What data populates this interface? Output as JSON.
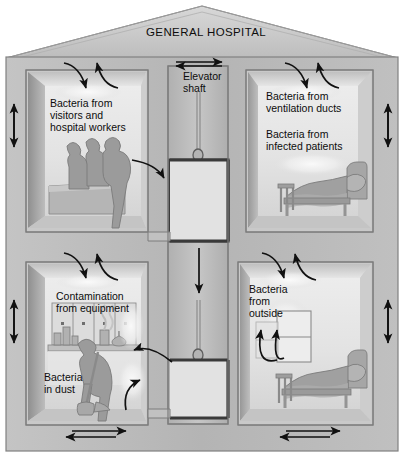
{
  "diagram": {
    "type": "cross-section-illustration",
    "title": "GENERAL HOSPITAL",
    "palette": {
      "wall_fill": "#b9b9b9",
      "wall_edge": "#8a8a8a",
      "roof_fill": "#c9c9c9",
      "room_back": "#dedede",
      "room_floor": "#cfcfcf",
      "room_side": "#a8a8a8",
      "furniture": "#a3a3a3",
      "figure": "#9a9a9a",
      "arrow": "#111111",
      "text": "#0d0d0d",
      "outline": "#6f6f6f",
      "white": "#f4f4f4"
    }
  },
  "labels": {
    "title": "GENERAL HOSPITAL",
    "elevator_shaft": "Elevator\nshaft",
    "upper_left": "Bacteria from\nvisitors and\nhospital workers",
    "upper_right_1": "Bacteria from\nventilation ducts",
    "upper_right_2": "Bacteria from\ninfected patients",
    "lower_left_1": "Contamination\nfrom equipment",
    "lower_left_2": "Bacteria\nin dust",
    "lower_right": "Bacteria\nfrom\noutside"
  },
  "rooms": [
    {
      "id": "upper-left",
      "name": "reception-ward",
      "label": "Bacteria from visitors and hospital workers",
      "contents": [
        "three-human-figures",
        "reception-desk"
      ],
      "airflow": [
        "ceiling-in",
        "ceiling-out",
        "left-wall-two-way",
        "to-elevator-shaft"
      ]
    },
    {
      "id": "upper-right",
      "name": "patient-room-upper",
      "label": "Bacteria from ventilation ducts / Bacteria from infected patients",
      "contents": [
        "hospital-bed",
        "patient",
        "pillow"
      ],
      "airflow": [
        "ceiling-in",
        "ceiling-out",
        "right-wall-two-way"
      ]
    },
    {
      "id": "lower-left",
      "name": "equipment-room",
      "label": "Contamination from equipment / Bacteria in dust",
      "contents": [
        "cabinets",
        "bench",
        "flasks",
        "bottles",
        "person-sweeping",
        "broom",
        "dust-cloud"
      ],
      "airflow": [
        "ceiling-in",
        "ceiling-out",
        "left-wall-two-way",
        "floor-two-way",
        "to-elevator-shaft"
      ]
    },
    {
      "id": "lower-right",
      "name": "patient-room-lower",
      "label": "Bacteria from outside",
      "contents": [
        "window",
        "hospital-bed",
        "patient",
        "pillow"
      ],
      "airflow": [
        "ceiling-in",
        "window-in",
        "right-wall-two-way",
        "floor-two-way"
      ]
    }
  ],
  "elevator": {
    "label": "Elevator\nshaft",
    "cars": 2,
    "features": [
      "cable",
      "upper-car",
      "lower-car",
      "downward-airflow-arrow",
      "top-two-way-arrow"
    ]
  },
  "arrows": [
    {
      "name": "roofline-two-way",
      "orientation": "horizontal",
      "heads": 2
    },
    {
      "name": "upper-left-ceiling-in",
      "orientation": "curved-down",
      "heads": 1
    },
    {
      "name": "upper-left-ceiling-out",
      "orientation": "curved-up",
      "heads": 1
    },
    {
      "name": "upper-right-ceiling-in",
      "orientation": "curved-down",
      "heads": 1
    },
    {
      "name": "upper-right-ceiling-out",
      "orientation": "curved-up",
      "heads": 1
    },
    {
      "name": "lower-left-ceiling-in",
      "orientation": "curved-down",
      "heads": 1
    },
    {
      "name": "lower-left-ceiling-out",
      "orientation": "curved-up",
      "heads": 1
    },
    {
      "name": "lower-right-ceiling-in",
      "orientation": "curved-down",
      "heads": 1
    },
    {
      "name": "lower-right-ceiling-out",
      "orientation": "curved-up",
      "heads": 1
    },
    {
      "name": "left-wall-upper-two-way",
      "orientation": "vertical",
      "heads": 2
    },
    {
      "name": "left-wall-lower-two-way",
      "orientation": "vertical",
      "heads": 2
    },
    {
      "name": "right-wall-upper-two-way",
      "orientation": "vertical",
      "heads": 2
    },
    {
      "name": "right-wall-lower-two-way",
      "orientation": "vertical",
      "heads": 2
    },
    {
      "name": "elevator-downdraft",
      "orientation": "vertical-down",
      "heads": 1
    },
    {
      "name": "ward-to-shaft",
      "orientation": "curved-right",
      "heads": 1
    },
    {
      "name": "shaft-to-equipment-room",
      "orientation": "curved-left",
      "heads": 1
    },
    {
      "name": "dust-rising",
      "orientation": "curved-up",
      "heads": 1
    },
    {
      "name": "window-inflow-left",
      "orientation": "curved-up",
      "heads": 1
    },
    {
      "name": "window-inflow-right",
      "orientation": "curved-up",
      "heads": 1
    },
    {
      "name": "lower-left-floor-two-way",
      "orientation": "horizontal",
      "heads": 2
    },
    {
      "name": "lower-right-floor-two-way",
      "orientation": "horizontal",
      "heads": 2
    }
  ]
}
